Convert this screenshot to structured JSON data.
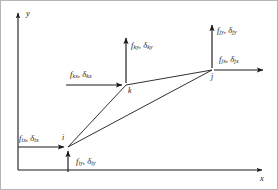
{
  "figure": {
    "stroke_color": "#1a1a1a",
    "background_color": "#ffffff",
    "axes": {
      "x_label": "x",
      "y_label": "y",
      "origin_px": [
        18,
        170
      ],
      "x_axis_end_px": [
        265,
        170
      ],
      "y_axis_end_px": [
        18,
        10
      ]
    },
    "nodes": [
      {
        "id": "i",
        "label": "i",
        "x_px": 68,
        "y_px": 147
      },
      {
        "id": "k",
        "label": "k",
        "x_px": 126,
        "y_px": 85
      },
      {
        "id": "j",
        "label": "j",
        "x_px": 212,
        "y_px": 70
      }
    ],
    "element_edges": [
      [
        "i",
        "k"
      ],
      [
        "k",
        "j"
      ],
      [
        "j",
        "i"
      ]
    ],
    "force_labels": {
      "i_x": {
        "f": "f",
        "f_sub": "ix",
        "d": "δ",
        "d_sub": "ix",
        "text": "f ix , δ ix"
      },
      "i_y": {
        "f": "f",
        "f_sub": "iy",
        "d": "δ",
        "d_sub": "iy",
        "text": "f iy , δ iy"
      },
      "k_x": {
        "f": "f",
        "f_sub": "kx",
        "d": "δ",
        "d_sub": "kx",
        "text": "f kx , δ kx"
      },
      "k_y": {
        "f": "f",
        "f_sub": "ky",
        "d": "δ",
        "d_sub": "ky",
        "text": "f ky , δ ky"
      },
      "j_x": {
        "f": "f",
        "f_sub": "jx",
        "d": "δ",
        "d_sub": "jx",
        "text": "f jx , δ jx"
      },
      "j_y": {
        "f": "f",
        "f_sub": "jy",
        "d": "δ",
        "d_sub": "jy",
        "text": "f jy , δ jy"
      }
    },
    "arrows": [
      {
        "name": "force-arrow-ix",
        "from_px": [
          18,
          147
        ],
        "to_px": [
          66,
          147
        ],
        "direction": "right"
      },
      {
        "name": "force-arrow-iy",
        "from_px": [
          68,
          172
        ],
        "to_px": [
          68,
          149
        ],
        "direction": "up"
      },
      {
        "name": "force-arrow-kx",
        "from_px": [
          66,
          85
        ],
        "to_px": [
          124,
          85
        ],
        "direction": "right"
      },
      {
        "name": "force-arrow-ky",
        "from_px": [
          126,
          83
        ],
        "to_px": [
          126,
          35
        ],
        "direction": "up"
      },
      {
        "name": "force-arrow-jx",
        "from_px": [
          214,
          70
        ],
        "to_px": [
          266,
          70
        ],
        "direction": "right"
      },
      {
        "name": "force-arrow-jy",
        "from_px": [
          212,
          68
        ],
        "to_px": [
          212,
          22
        ],
        "direction": "up"
      }
    ],
    "border": {
      "visible": true,
      "color": "#9a9a9a"
    }
  }
}
